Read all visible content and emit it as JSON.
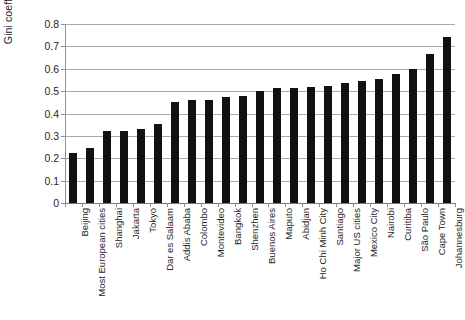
{
  "chart_data": {
    "type": "bar",
    "title": "",
    "subtitle": "",
    "xlabel": "",
    "ylabel": "Gini coefficient",
    "ylim": [
      0,
      0.8
    ],
    "ytick_labels": [
      "0",
      "0.1",
      "0.2",
      "0.3",
      "0.4",
      "0.5",
      "0.6",
      "0.7",
      "0.8"
    ],
    "ytick_values": [
      0,
      0.1,
      0.2,
      0.3,
      0.4,
      0.5,
      0.6,
      0.7,
      0.8
    ],
    "grid": "horizontal",
    "legend": "none",
    "bar_color": "#111111",
    "grid_color": "#a8a8a8",
    "axis_color": "#8c8c8c",
    "categories": [
      "Beijing",
      "Most European cities",
      "Shanghai",
      "Jakarta",
      "Tokyo",
      "Dar es Salaam",
      "Addis Ababa",
      "Colombo",
      "Montevideo",
      "Bangkok",
      "Shenzhen",
      "Buenos Aires",
      "Maputo",
      "Abidjan",
      "Ho Chi Minh City",
      "Santiago",
      "Major US cities",
      "Mexico City",
      "Nairobi",
      "Curitiba",
      "São Paulo",
      "Cape Town",
      "Johannesburg"
    ],
    "values": [
      0.225,
      0.247,
      0.32,
      0.32,
      0.33,
      0.355,
      0.45,
      0.46,
      0.46,
      0.475,
      0.478,
      0.5,
      0.515,
      0.515,
      0.52,
      0.525,
      0.535,
      0.545,
      0.555,
      0.575,
      0.6,
      0.665,
      0.74
    ]
  }
}
